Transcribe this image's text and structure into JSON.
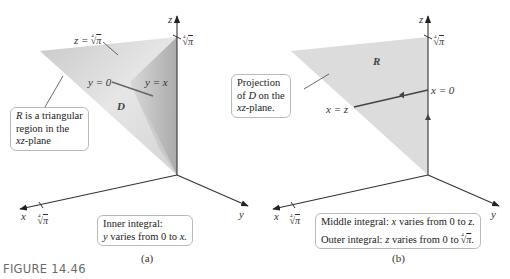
{
  "figure": {
    "title": "FIGURE 14.46",
    "colors": {
      "region_light": "#e3e3e3",
      "region_mid": "#cfcfcf",
      "region_dark": "#a9a9a9",
      "axis": "#333333",
      "leader": "#555555"
    }
  },
  "panel_a": {
    "caption": "(a)",
    "axes": {
      "x": "x",
      "y": "y",
      "z": "z"
    },
    "ticks": {
      "z_tick": "π",
      "x_tick": "π",
      "root_index": "4"
    },
    "labels": {
      "plane_top": "z = ",
      "plane_top_root": "π",
      "y_zero": "y = 0",
      "y_eq_x": "y = x",
      "region": "D"
    },
    "callout_region": {
      "line1_var": "R",
      "line1_rest": " is a triangular",
      "line2": "region in the",
      "line3_var": "xz",
      "line3_rest": "-plane"
    },
    "callout_integral": {
      "line1": "Inner integral:",
      "line2_var": "y",
      "line2_mid": " varies from 0 to ",
      "line2_end": "x."
    }
  },
  "panel_b": {
    "caption": "(b)",
    "axes": {
      "x": "x",
      "y": "y",
      "z": "z"
    },
    "ticks": {
      "z_tick": "π",
      "x_tick": "π",
      "root_index": "4"
    },
    "labels": {
      "region": "R",
      "x_zero": "x = 0",
      "x_eq_z": "x = z"
    },
    "callout_projection": {
      "line1": "Projection",
      "line2_pre": "of ",
      "line2_var": "D",
      "line2_rest": " on the",
      "line3_var": "xz",
      "line3_rest": "-plane."
    },
    "callout_integral": {
      "line1_pre": "Middle integral: ",
      "line1_var": "x",
      "line1_mid": " varies from 0 to ",
      "line1_end": "z.",
      "line2_pre": "Outer integral: ",
      "line2_var": "z",
      "line2_mid": " varies from 0 to ",
      "line2_root": "π",
      "line2_end": "."
    }
  }
}
